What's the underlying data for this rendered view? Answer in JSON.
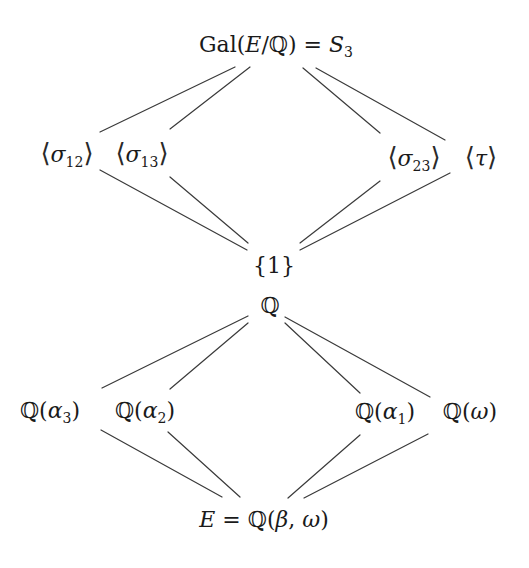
{
  "diagram": {
    "type": "galois-correspondence",
    "groups_lattice": {
      "top": {
        "id": "gal",
        "label": "Gal(E/ℚ) = S₃",
        "parts": {
          "prefix": "Gal(",
          "E": "E",
          "slash": "/",
          "Q": "ℚ",
          "suffix": ") = ",
          "S": "S",
          "sub": "3"
        }
      },
      "middle": [
        {
          "id": "s12",
          "label": "⟨σ₁₂⟩",
          "sym": "σ",
          "sub": "12"
        },
        {
          "id": "s13",
          "label": "⟨σ₁₃⟩",
          "sym": "σ",
          "sub": "13"
        },
        {
          "id": "s23",
          "label": "⟨σ₂₃⟩",
          "sym": "σ",
          "sub": "23"
        },
        {
          "id": "tau",
          "label": "⟨τ⟩",
          "sym": "τ",
          "sub": ""
        }
      ],
      "bottom": {
        "id": "one",
        "label": "{1}"
      }
    },
    "fields_lattice": {
      "top": {
        "id": "Q",
        "label": "ℚ"
      },
      "middle": [
        {
          "id": "qa3",
          "label": "ℚ(α₃)",
          "field": "ℚ(",
          "sym": "α",
          "sub": "3",
          "close": ")"
        },
        {
          "id": "qa2",
          "label": "ℚ(α₂)",
          "field": "ℚ(",
          "sym": "α",
          "sub": "2",
          "close": ")"
        },
        {
          "id": "qa1",
          "label": "ℚ(α₁)",
          "field": "ℚ(",
          "sym": "α",
          "sub": "1",
          "close": ")"
        },
        {
          "id": "qw",
          "label": "ℚ(ω)",
          "field": "ℚ(",
          "sym": "ω",
          "sub": "",
          "close": ")"
        }
      ],
      "bottom": {
        "id": "E",
        "label": "E = ℚ(β, ω)",
        "parts": {
          "E": "E",
          "eq": " = ℚ(",
          "beta": "β",
          "comma": ", ",
          "omega": "ω",
          "close": ")"
        }
      }
    },
    "angle_left": "⟨",
    "angle_right": "⟩",
    "brace_label": "{1}",
    "Q_label": "ℚ"
  }
}
